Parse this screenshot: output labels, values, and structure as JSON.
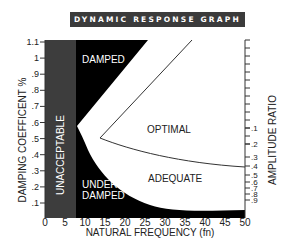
{
  "title": "DYNAMIC RESPONSE GRAPH",
  "chart_data": {
    "type": "area",
    "title": "DYNAMIC RESPONSE GRAPH",
    "xlabel": "NATURAL FREQUENCY (fn)",
    "ylabel": "DAMPING COEFFICENT %",
    "y2label": "AMPLITUDE RATIO",
    "xlim": [
      0,
      50
    ],
    "ylim": [
      0,
      1.1
    ],
    "x_ticks": [
      "0",
      "5",
      "10",
      "15",
      "20",
      "25",
      "30",
      "35",
      "40",
      "45",
      "50"
    ],
    "y_ticks": [
      ".1",
      ".2",
      ".3",
      ".4",
      ".5",
      ".6",
      ".7",
      ".8",
      ".9",
      "1",
      "1.1"
    ],
    "y2_ticks": [
      ".1",
      ".2",
      ".3",
      ".4",
      ".5",
      ".6",
      ".7",
      ".8",
      ".9"
    ],
    "regions": [
      {
        "name": "UNACCEPTABLE",
        "x_range": [
          0,
          7.5
        ],
        "color": "#3d3d3d"
      },
      {
        "name": "DAMPED",
        "boundary": [
          [
            7.5,
            1.1
          ],
          [
            26,
            1.1
          ],
          [
            8,
            0.57
          ]
        ],
        "color": "#000000"
      },
      {
        "name": "UNDER-DAMPED",
        "boundary": [
          [
            7.5,
            0.57
          ],
          [
            12,
            0.4
          ],
          [
            20,
            0.2
          ],
          [
            30,
            0.08
          ],
          [
            50,
            0.05
          ]
        ],
        "color": "#000000"
      },
      {
        "name": "OPTIMAL",
        "color": "#ffffff"
      },
      {
        "name": "ADEQUATE",
        "color": "#ffffff"
      }
    ],
    "series": [
      {
        "name": "optimal-upper-boundary",
        "x": [
          37,
          14
        ],
        "y": [
          1.1,
          0.5
        ]
      },
      {
        "name": "optimal-lower-boundary",
        "x": [
          14,
          25,
          35,
          50
        ],
        "y": [
          0.5,
          0.38,
          0.33,
          0.31
        ]
      }
    ],
    "region_labels": [
      "DAMPED",
      "UNACCEPTABLE",
      "OPTIMAL",
      "ADEQUATE",
      "UNDER-DAMPED"
    ],
    "grid": false
  },
  "labels": {
    "damped": "DAMPED",
    "unacceptable": "UNACCEPTABLE",
    "optimal": "OPTIMAL",
    "adequate": "ADEQUATE",
    "under1": "UNDER-",
    "under2": "DAMPED",
    "xlabel": "NATURAL FREQUENCY (fn)",
    "ylabel": "DAMPING COEFFICENT %",
    "y2label": "AMPLITUDE RATIO"
  },
  "x_ticks": [
    "0",
    "5",
    "10",
    "15",
    "20",
    "25",
    "30",
    "35",
    "40",
    "45",
    "50"
  ],
  "y_ticks": [
    ".1",
    ".2",
    ".3",
    ".4",
    ".5",
    ".6",
    ".7",
    ".8",
    ".9",
    "1",
    "1.1"
  ],
  "y2_ticks": [
    ".1",
    ".2",
    ".3",
    ".4",
    ".5",
    ".6",
    ".7",
    ".8",
    ".9"
  ]
}
